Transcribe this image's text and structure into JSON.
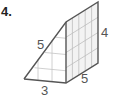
{
  "problem_number": "4.",
  "figure": {
    "type": "triangular-prism",
    "labels": {
      "base": "3",
      "slant": "5",
      "height": "4",
      "depth": "5"
    },
    "colors": {
      "edge": "#555555",
      "grid": "#bbbbbb",
      "face_fill": "#f2f2f2"
    }
  }
}
